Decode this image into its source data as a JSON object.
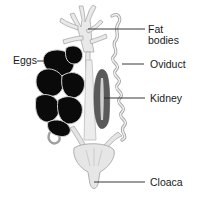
{
  "diagram": {
    "labels": [
      {
        "id": "fat-bodies",
        "text": "Fat\nbodies",
        "x": 148,
        "y": 24
      },
      {
        "id": "eggs",
        "text": "Eggs",
        "x": 13,
        "y": 55
      },
      {
        "id": "oviduct",
        "text": "Oviduct",
        "x": 150,
        "y": 59
      },
      {
        "id": "kidney",
        "text": "Kidney",
        "x": 150,
        "y": 93
      },
      {
        "id": "cloaca",
        "text": "Cloaca",
        "x": 150,
        "y": 177
      }
    ],
    "colors": {
      "background": "#ffffff",
      "eggs": "#0a0a0a",
      "kidney": "#5a5a5a",
      "kidney_stripe": "#cfcfcf",
      "tissue_light": "#e6e6e6",
      "tissue_outline": "#a8a8a8",
      "leader_line": "#222222",
      "text": "#1a1a1a"
    }
  }
}
